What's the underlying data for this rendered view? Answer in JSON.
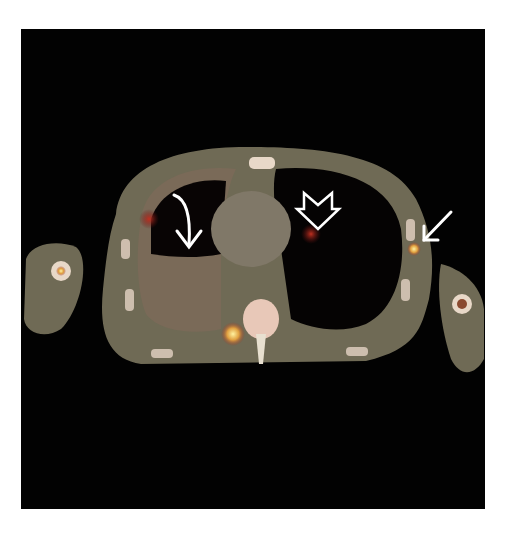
{
  "image": {
    "description": "Axial fused PET/CT image of the chest",
    "background_color": "#020202",
    "page_color": "#ffffff",
    "annotations": [
      {
        "id": "curved-arrow",
        "kind": "curved-arrow",
        "color": "#ffffff",
        "target": "right pleural effusion / lower lobe"
      },
      {
        "id": "open-arrow",
        "kind": "open-arrow",
        "color": "#ffffff",
        "target": "left hilar uptake"
      },
      {
        "id": "straight-arrow",
        "kind": "straight-arrow",
        "color": "#ffffff",
        "target": "left axillary focal uptake"
      }
    ],
    "colors": {
      "soft_tissue": "#6f6a55",
      "bone": "#e8d8c8",
      "uptake_hot": "#f0d060",
      "uptake_red": "#a02818",
      "lung": "#050303"
    }
  }
}
